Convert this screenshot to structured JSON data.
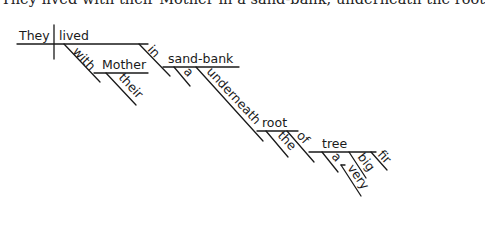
{
  "sentence": "They lived with their Mother in a sand-bank, underneath the root",
  "diagram": {
    "subject": "They",
    "verb": "lived",
    "phrases": {
      "with": {
        "prep": "with",
        "object": "Mother",
        "modifiers": [
          "their"
        ]
      },
      "in": {
        "prep": "in",
        "object": "sand-bank",
        "modifiers": [
          "a"
        ]
      },
      "underneath": {
        "prep": "underneath",
        "object": "root",
        "modifiers": [
          "the"
        ]
      },
      "of": {
        "prep": "of",
        "object": "tree",
        "modifiers": [
          "a",
          "big",
          "fir"
        ],
        "adverb": "very"
      }
    }
  },
  "colors": {
    "ink": "#1a1a1a",
    "background": "#ffffff"
  }
}
